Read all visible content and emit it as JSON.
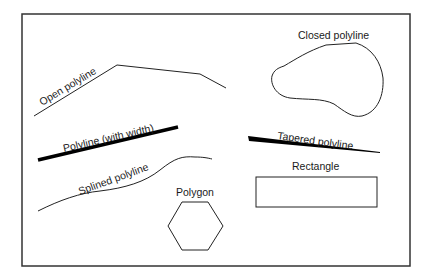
{
  "diagram": {
    "frame": {
      "x": 22,
      "y": 14,
      "width": 388,
      "height": 252,
      "stroke": "#333333"
    },
    "shapes": [
      {
        "id": "open-polyline",
        "label": "Open polyline",
        "label_pos": [
          42,
          106
        ],
        "label_rotate": -31
      },
      {
        "id": "closed-polyline",
        "label": "Closed polyline",
        "label_pos": [
          298,
          39
        ],
        "label_rotate": 0
      },
      {
        "id": "polyline-with-width",
        "label": "Polyline (with width)",
        "label_pos": [
          64,
          152
        ],
        "label_rotate": -13
      },
      {
        "id": "tapered-polyline",
        "label": "Tapered polyline",
        "label_pos": [
          277,
          139
        ],
        "label_rotate": 8
      },
      {
        "id": "splined-polyline",
        "label": "Splined polyline",
        "label_pos": [
          80,
          195
        ],
        "label_rotate": -20
      },
      {
        "id": "polygon",
        "label": "Polygon",
        "label_pos": [
          176,
          196
        ],
        "label_rotate": 0
      },
      {
        "id": "rectangle",
        "label": "Rectangle",
        "label_pos": [
          292,
          170
        ],
        "label_rotate": 0
      }
    ]
  }
}
